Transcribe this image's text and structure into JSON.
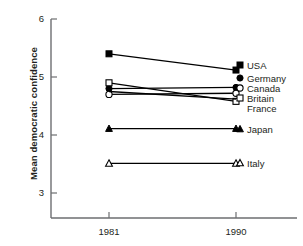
{
  "chart_data": {
    "type": "line",
    "title": "",
    "xlabel": "",
    "ylabel": "Mean democratic confidence",
    "x": [
      "1981",
      "1990"
    ],
    "xtick_labels": [
      "1981",
      "1990"
    ],
    "ytick_labels": [
      "3",
      "4",
      "5",
      "6"
    ],
    "ylim": [
      2.6,
      6.0
    ],
    "yticks": [
      3,
      4,
      5,
      6
    ],
    "grid": false,
    "legend_position": "right-inline",
    "series": [
      {
        "name": "USA",
        "label": "USA",
        "marker": "filled-square",
        "values": [
          5.4,
          5.12
        ]
      },
      {
        "name": "Germany",
        "label": "Germany",
        "marker": "filled-circle",
        "values": [
          4.8,
          4.82
        ]
      },
      {
        "name": "Canada",
        "label": "Canada",
        "marker": "open-circle",
        "values": [
          4.7,
          4.72
        ]
      },
      {
        "name": "Britain",
        "label": "Britain",
        "marker": "open-square",
        "values": [
          4.9,
          4.58
        ]
      },
      {
        "name": "France",
        "label": "France",
        "marker": "none",
        "values": [
          4.75,
          4.62
        ]
      },
      {
        "name": "Japan",
        "label": "Japan",
        "marker": "filled-triangle",
        "values": [
          4.11,
          4.11
        ]
      },
      {
        "name": "Italy",
        "label": "Italy",
        "marker": "open-triangle",
        "values": [
          3.51,
          3.51
        ]
      }
    ],
    "series_labels": [
      {
        "label": "USA",
        "y_px": 65
      },
      {
        "label": "Germany",
        "y_px": 78
      },
      {
        "label": "Canada",
        "y_px": 88
      },
      {
        "label": "Britain",
        "y_px": 98
      },
      {
        "label": "France",
        "y_px": 108
      },
      {
        "label": "Japan",
        "y_px": 129
      },
      {
        "label": "Italy",
        "y_px": 163
      }
    ],
    "axis_color": "#6d6e71",
    "line_color": "#000000"
  }
}
